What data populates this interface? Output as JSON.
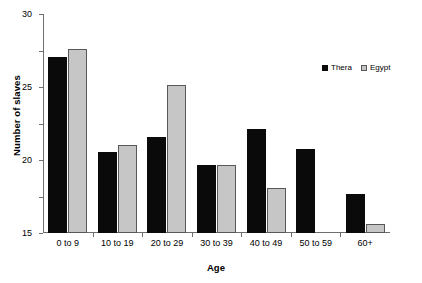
{
  "chart_data": {
    "type": "bar",
    "title": "",
    "xlabel": "Age",
    "ylabel": "Number of slaves",
    "categories": [
      "0 to 9",
      "10 to 19",
      "20 to 29",
      "30 to 39",
      "40 to 49",
      "50 to 59",
      "60+"
    ],
    "series": [
      {
        "name": "Thera",
        "color": "#0a0a0a",
        "values": [
          24.1,
          11.1,
          13.2,
          9.3,
          14.2,
          11.5,
          5.4
        ]
      },
      {
        "name": "Egypt",
        "color": "#c6c6c6",
        "values": [
          25.2,
          12.1,
          20.3,
          9.3,
          6.2,
          0,
          1.3
        ]
      }
    ],
    "ylim": [
      0,
      30
    ],
    "yticks": [
      0,
      5,
      10,
      15,
      20,
      25,
      30
    ],
    "ytick_labels": [
      "0",
      "5",
      "10",
      "15",
      "20",
      "25",
      "30"
    ],
    "grid": false,
    "legend_position": "upper right"
  },
  "legend": {
    "entries": [
      {
        "label": "Thera"
      },
      {
        "label": "Egypt"
      }
    ]
  }
}
